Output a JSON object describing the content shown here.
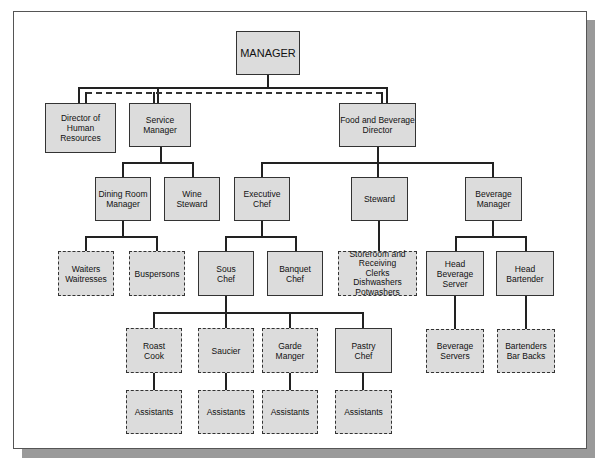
{
  "chart": {
    "nodes": [
      {
        "id": "manager",
        "label": "MANAGER",
        "style": "solid"
      },
      {
        "id": "hr",
        "label": "Director of\nHuman\nResources",
        "style": "solid"
      },
      {
        "id": "service",
        "label": "Service\nManager",
        "style": "solid"
      },
      {
        "id": "fb",
        "label": "Food and Beverage\nDirector",
        "style": "solid"
      },
      {
        "id": "dining",
        "label": "Dining Room\nManager",
        "style": "solid"
      },
      {
        "id": "wine",
        "label": "Wine\nSteward",
        "style": "solid"
      },
      {
        "id": "exec",
        "label": "Executive\nChef",
        "style": "solid"
      },
      {
        "id": "steward",
        "label": "Steward",
        "style": "solid"
      },
      {
        "id": "bevmgr",
        "label": "Beverage\nManager",
        "style": "solid"
      },
      {
        "id": "waiters",
        "label": "Waiters\nWaitresses",
        "style": "dashed"
      },
      {
        "id": "bus",
        "label": "Buspersons",
        "style": "dashed"
      },
      {
        "id": "sous",
        "label": "Sous\nChef",
        "style": "solid"
      },
      {
        "id": "banquet",
        "label": "Banquet\nChef",
        "style": "solid"
      },
      {
        "id": "store",
        "label": "Storeroom and\nReceiving\nClerks\nDishwashers\nPotwashers",
        "style": "dashed"
      },
      {
        "id": "headbev",
        "label": "Head\nBeverage\nServer",
        "style": "solid"
      },
      {
        "id": "headbar",
        "label": "Head\nBartender",
        "style": "solid"
      },
      {
        "id": "roast",
        "label": "Roast\nCook",
        "style": "dashed"
      },
      {
        "id": "saucier",
        "label": "Saucier",
        "style": "dashed"
      },
      {
        "id": "garde",
        "label": "Garde\nManger",
        "style": "dashed"
      },
      {
        "id": "pastry",
        "label": "Pastry\nChef",
        "style": "solid"
      },
      {
        "id": "bevservers",
        "label": "Beverage\nServers",
        "style": "dashed"
      },
      {
        "id": "bartenders",
        "label": "Bartenders\nBar Backs",
        "style": "dashed"
      },
      {
        "id": "asst1",
        "label": "Assistants",
        "style": "dashed"
      },
      {
        "id": "asst2",
        "label": "Assistants",
        "style": "dashed"
      },
      {
        "id": "asst3",
        "label": "Assistants",
        "style": "dashed"
      },
      {
        "id": "asst4",
        "label": "Assistants",
        "style": "dashed"
      }
    ],
    "edges": [
      [
        "manager",
        "hr"
      ],
      [
        "manager",
        "service"
      ],
      [
        "manager",
        "fb"
      ],
      [
        "service",
        "dining"
      ],
      [
        "service",
        "wine"
      ],
      [
        "fb",
        "exec"
      ],
      [
        "fb",
        "steward"
      ],
      [
        "fb",
        "bevmgr"
      ],
      [
        "dining",
        "waiters"
      ],
      [
        "dining",
        "bus"
      ],
      [
        "exec",
        "sous"
      ],
      [
        "exec",
        "banquet"
      ],
      [
        "steward",
        "store"
      ],
      [
        "bevmgr",
        "headbev"
      ],
      [
        "bevmgr",
        "headbar"
      ],
      [
        "sous",
        "roast"
      ],
      [
        "sous",
        "saucier"
      ],
      [
        "sous",
        "garde"
      ],
      [
        "sous",
        "pastry"
      ],
      [
        "headbev",
        "bevservers"
      ],
      [
        "headbar",
        "bartenders"
      ],
      [
        "roast",
        "asst1"
      ],
      [
        "saucier",
        "asst2"
      ],
      [
        "garde",
        "asst3"
      ],
      [
        "pastry",
        "asst4"
      ]
    ],
    "dashed_edges": [
      [
        "hr",
        "service"
      ],
      [
        "service",
        "fb"
      ]
    ]
  }
}
